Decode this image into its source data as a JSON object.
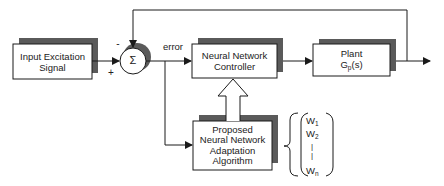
{
  "diagram": {
    "type": "block-diagram",
    "colors": {
      "line": "#1a1a1a",
      "shadow": "#5a5a5a",
      "box_fill": "#ffffff",
      "text": "#222222"
    },
    "blocks": {
      "input": {
        "line1": "Input Excitation",
        "line2": "Signal"
      },
      "summer": {
        "symbol": "Σ",
        "minus_sign": "-",
        "plus_sign": "+"
      },
      "controller": {
        "line1": "Neural Network",
        "line2": "Controller"
      },
      "plant": {
        "line1": "Plant",
        "line2_main": "G",
        "line2_sub": "p",
        "line2_tail": "(s)"
      },
      "adaptation": {
        "line1": "Proposed",
        "line2": "Neural Network",
        "line3": "Adaptation",
        "line4": "Algorithm"
      }
    },
    "labels": {
      "error": "error"
    },
    "weights": {
      "w1_main": "W",
      "w1_sub": "1",
      "w2_main": "W",
      "w2_sub": "2",
      "dots1": "|",
      "dots2": "|",
      "wn_main": "W",
      "wn_sub": "n"
    }
  }
}
